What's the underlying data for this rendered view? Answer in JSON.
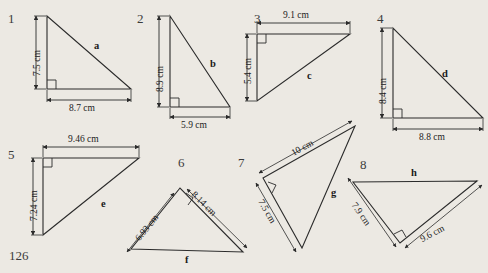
{
  "page": {
    "page_number": "126",
    "background_color": "#ece9e3",
    "ink_color": "#222222"
  },
  "figures": [
    {
      "number": "1",
      "num_pos": [
        8,
        12
      ],
      "shape": "right-triangle",
      "right_angle_at": "bottom-left",
      "vertices": [
        [
          47,
          16
        ],
        [
          47,
          89
        ],
        [
          131,
          89
        ]
      ],
      "vertical_label": "7.5 cm",
      "horizontal_label": "8.7 cm",
      "hyp_label": "a"
    },
    {
      "number": "2",
      "num_pos": [
        137,
        12
      ],
      "shape": "right-triangle",
      "right_angle_at": "bottom-left",
      "vertices": [
        [
          170,
          16
        ],
        [
          170,
          107
        ],
        [
          230,
          107
        ]
      ],
      "vertical_label": "8.9 cm",
      "horizontal_label": "5.9 cm",
      "hyp_label": "b"
    },
    {
      "number": "3",
      "num_pos": [
        254,
        12
      ],
      "shape": "right-triangle",
      "right_angle_at": "top-left",
      "vertices": [
        [
          257,
          34
        ],
        [
          350,
          34
        ],
        [
          257,
          101
        ]
      ],
      "vertical_label": "5.4 cm",
      "horizontal_label": "9.1 cm",
      "hyp_label": "c"
    },
    {
      "number": "4",
      "num_pos": [
        377,
        12
      ],
      "shape": "right-triangle",
      "right_angle_at": "bottom-left",
      "vertices": [
        [
          393,
          28
        ],
        [
          393,
          118
        ],
        [
          483,
          118
        ]
      ],
      "vertical_label": "8.4 cm",
      "horizontal_label": "8.8 cm",
      "hyp_label": "d"
    },
    {
      "number": "5",
      "num_pos": [
        8,
        148
      ],
      "shape": "right-triangle",
      "right_angle_at": "top-left",
      "vertices": [
        [
          43,
          158
        ],
        [
          139,
          158
        ],
        [
          43,
          235
        ]
      ],
      "vertical_label": "7.24 cm",
      "horizontal_label": "9.46 cm",
      "hyp_label": "e"
    },
    {
      "number": "6",
      "num_pos": [
        178,
        156
      ],
      "shape": "right-triangle",
      "right_angle_at": "apex",
      "vertices": [
        [
          180,
          188
        ],
        [
          131,
          249
        ],
        [
          243,
          252
        ]
      ],
      "left_leg_label": "6.93 cm",
      "right_leg_label": "8.14 cm",
      "hyp_label": "f"
    },
    {
      "number": "7",
      "num_pos": [
        238,
        156
      ],
      "shape": "right-triangle",
      "right_angle_at": "left",
      "vertices": [
        [
          263,
          178
        ],
        [
          355,
          126
        ],
        [
          302,
          248
        ]
      ],
      "top_leg_label": "10 cm",
      "bottom_leg_label": "7.5 cm",
      "hyp_label": "g"
    },
    {
      "number": "8",
      "num_pos": [
        360,
        158
      ],
      "shape": "right-triangle",
      "right_angle_at": "bottom",
      "vertices": [
        [
          400,
          243
        ],
        [
          353,
          182
        ],
        [
          477,
          181
        ]
      ],
      "left_leg_label": "7.9 cm",
      "right_leg_label": "9.6 cm",
      "hyp_label": "h"
    }
  ]
}
